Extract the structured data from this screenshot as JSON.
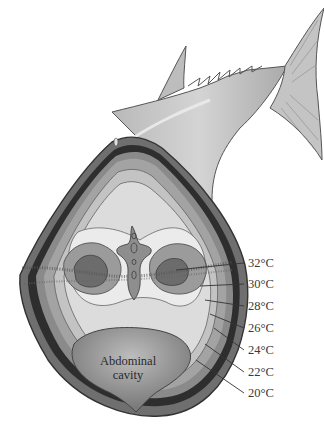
{
  "diagram": {
    "cavity_label_line1": "Abdominal",
    "cavity_label_line2": "cavity",
    "isotherms": [
      {
        "label": "32°C",
        "y": 263
      },
      {
        "label": "30°C",
        "y": 284
      },
      {
        "label": "28°C",
        "y": 306
      },
      {
        "label": "26°C",
        "y": 328
      },
      {
        "label": "24°C",
        "y": 350
      },
      {
        "label": "22°C",
        "y": 372
      },
      {
        "label": "20°C",
        "y": 393
      }
    ]
  }
}
